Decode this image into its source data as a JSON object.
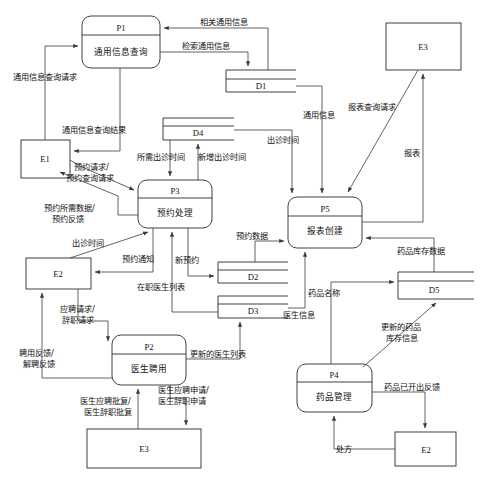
{
  "diagram": {
    "type": "data-flow-diagram",
    "colors": {
      "stroke": "#2b2b2b",
      "flow": "#3a3a3a",
      "background": "#ffffff"
    }
  },
  "processes": [
    {
      "id": "P1",
      "name": "通用信息查询",
      "x": 82,
      "y": 16,
      "w": 78,
      "h": 52
    },
    {
      "id": "P3",
      "name": "预约处理",
      "x": 138,
      "y": 180,
      "w": 74,
      "h": 48
    },
    {
      "id": "P5",
      "name": "报表创建",
      "x": 288,
      "y": 197,
      "w": 74,
      "h": 51
    },
    {
      "id": "P2",
      "name": "医生聘用",
      "x": 112,
      "y": 335,
      "w": 74,
      "h": 50
    },
    {
      "id": "P4",
      "name": "药品管理",
      "x": 297,
      "y": 364,
      "w": 75,
      "h": 48
    }
  ],
  "datastores": [
    {
      "id": "D1",
      "x": 226,
      "y": 70,
      "w": 70,
      "h": 22
    },
    {
      "id": "D4",
      "x": 163,
      "y": 118,
      "w": 71,
      "h": 22
    },
    {
      "id": "D2",
      "x": 218,
      "y": 262,
      "w": 70,
      "h": 21
    },
    {
      "id": "D3",
      "x": 218,
      "y": 296,
      "w": 70,
      "h": 22
    },
    {
      "id": "D5",
      "x": 398,
      "y": 272,
      "w": 71,
      "h": 27
    }
  ],
  "externals": [
    {
      "id": "E1",
      "x": 21,
      "y": 140,
      "w": 49,
      "h": 38
    },
    {
      "id": "E3",
      "x": 386,
      "y": 23,
      "w": 75,
      "h": 47
    },
    {
      "id": "E2",
      "x": 26,
      "y": 258,
      "w": 65,
      "h": 31
    },
    {
      "id": "E3b",
      "id_label": "E3",
      "x": 87,
      "y": 429,
      "w": 114,
      "h": 39
    },
    {
      "id": "E2b",
      "id_label": "E2",
      "x": 395,
      "y": 432,
      "w": 61,
      "h": 34
    }
  ],
  "flows": [
    {
      "name": "通用信息查询请求",
      "label": "通用信息查询请求",
      "from": "E1",
      "to": "P1"
    },
    {
      "name": "通用信息查询结果",
      "label": "通用信息查询结果",
      "from": "P1",
      "to": "E1"
    },
    {
      "name": "相关通用信息",
      "label": "相关通用信息",
      "from": "D1",
      "to": "P1"
    },
    {
      "name": "检索通用信息",
      "label": "检索通用信息",
      "from": "P1",
      "to": "D1"
    },
    {
      "name": "通用信息",
      "label": "通用信息",
      "from": "D1",
      "to": "P5"
    },
    {
      "name": "所需出诊时间",
      "label": "所需出诊时间",
      "from": "D4",
      "to": "P3"
    },
    {
      "name": "新增出诊时间",
      "label": "新增出诊时间",
      "from": "P3",
      "to": "D4"
    },
    {
      "name": "出诊时间-P5",
      "label": "出诊时间",
      "from": "D4",
      "to": "P5"
    },
    {
      "name": "预约请求/预约查询请求",
      "label": "预约请求/\n预约查询请求",
      "from": "E1",
      "to": "P3"
    },
    {
      "name": "预约所需数据/预约反馈",
      "label": "预约所需数据/\n预约反馈",
      "from": "P3",
      "to": "E1"
    },
    {
      "name": "出诊时间-E2",
      "label": "出诊时间",
      "from": "E2",
      "to": "P3"
    },
    {
      "name": "预约通知",
      "label": "预约通知",
      "from": "P3",
      "to": "E2"
    },
    {
      "name": "新预约",
      "label": "新预约",
      "from": "P3",
      "to": "D2"
    },
    {
      "name": "在职医生列表",
      "label": "在职医生列表",
      "from": "D3",
      "to": "P3"
    },
    {
      "name": "预约数据",
      "label": "预约数据",
      "from": "D2",
      "to": "P5"
    },
    {
      "name": "医生信息",
      "label": "医生信息",
      "from": "D3",
      "to": "P5"
    },
    {
      "name": "报表查询请求",
      "label": "报表查询请求",
      "from": "E3",
      "to": "P5"
    },
    {
      "name": "报表",
      "label": "报表",
      "from": "P5",
      "to": "E3"
    },
    {
      "name": "药品库存数据",
      "label": "药品库存数据",
      "from": "D5",
      "to": "P5"
    },
    {
      "name": "应聘请求/辞职请求",
      "label": "应聘请求/\n辞职请求",
      "from": "E2",
      "to": "P2"
    },
    {
      "name": "聘用反馈/解聘反馈",
      "label": "聘用反馈/\n解聘反馈",
      "from": "P2",
      "to": "E2"
    },
    {
      "name": "更新的医生列表",
      "label": "更新的医生列表",
      "from": "P2",
      "to": "D3"
    },
    {
      "name": "医生应聘申请/医生辞职申请",
      "label": "医生应聘申请/\n医生辞职申请",
      "from": "P2",
      "to": "E3b"
    },
    {
      "name": "医生应聘批复/医生辞职批复",
      "label": "医生应聘批复/\n医生辞职批复",
      "from": "E3b",
      "to": "P2"
    },
    {
      "name": "药品名称",
      "label": "药品名称",
      "from": "P4",
      "to": "D5"
    },
    {
      "name": "更新的药品库存信息",
      "label": "更新的药品\n库存信息",
      "from": "P4",
      "to": "D5"
    },
    {
      "name": "药品已开出反馈",
      "label": "药品已开出反馈",
      "from": "P4",
      "to": "E2b"
    },
    {
      "name": "处方",
      "label": "处方",
      "from": "E2b",
      "to": "P4"
    }
  ],
  "labels": {
    "tongyong_chaxun_qingqiu": "通用信息查询请求",
    "tongyong_chaxun_jieguo": "通用信息查询结果",
    "xiangguan_tongyong": "相关通用信息",
    "jiansuo_tongyong": "检索通用信息",
    "tongyong_xinxi": "通用信息",
    "suoxu_chuzhen": "所需出诊时间",
    "xinzeng_chuzhen": "新增出诊时间",
    "chuzhen_shijian_p5": "出诊时间",
    "yuyue_qingqiu_1": "预约请求/",
    "yuyue_qingqiu_2": "预约查询请求",
    "yuyue_shuju_1": "预约所需数据/",
    "yuyue_shuju_2": "预约反馈",
    "chuzhen_shijian_e2": "出诊时间",
    "yuyue_tongzhi": "预约通知",
    "xin_yuyue": "新预约",
    "zaizhi_yisheng": "在职医生列表",
    "yuyue_data": "预约数据",
    "yisheng_xinxi": "医生信息",
    "baobiao_chaxun": "报表查询请求",
    "baobiao": "报表",
    "yaopin_kucun": "药品库存数据",
    "yingpin_1": "应聘请求/",
    "yingpin_2": "辞职请求",
    "pinyong_1": "聘用反馈/",
    "pinyong_2": "解聘反馈",
    "gengxin_yisheng": "更新的医生列表",
    "yisheng_shenqing_1": "医生应聘申请/",
    "yisheng_shenqing_2": "医生辞职申请",
    "yisheng_pifu_1": "医生应聘批复/",
    "yisheng_pifu_2": "医生辞职批复",
    "yaopin_mingcheng": "药品名称",
    "gengxin_yaopin_1": "更新的药品",
    "gengxin_yaopin_2": "库存信息",
    "yaopin_fankui": "药品已开出反馈",
    "chufang": "处方"
  },
  "nodes": {
    "p1_id": "P1",
    "p1_name": "通用信息查询",
    "p2_id": "P2",
    "p2_name": "医生聘用",
    "p3_id": "P3",
    "p3_name": "预约处理",
    "p4_id": "P4",
    "p4_name": "药品管理",
    "p5_id": "P5",
    "p5_name": "报表创建",
    "d1": "D1",
    "d2": "D2",
    "d3": "D3",
    "d4": "D4",
    "d5": "D5",
    "e1": "E1",
    "e2": "E2",
    "e3": "E3",
    "e3_top": "E3",
    "e3_bottom": "E3",
    "e2_left": "E2",
    "e2_bottom": "E2"
  }
}
